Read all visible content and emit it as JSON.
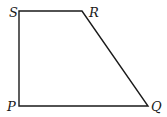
{
  "diagram": {
    "shape": "quadrilateral",
    "stroke_color": "#1a1a1a",
    "stroke_width": 1.4,
    "vertices": [
      {
        "label": "S",
        "x": 19,
        "y": 11,
        "label_x": 9,
        "label_y": 17
      },
      {
        "label": "R",
        "x": 82,
        "y": 11,
        "label_x": 89,
        "label_y": 17
      },
      {
        "label": "Q",
        "x": 148,
        "y": 106,
        "label_x": 151,
        "label_y": 111
      },
      {
        "label": "P",
        "x": 19,
        "y": 106,
        "label_x": 7,
        "label_y": 111
      }
    ],
    "edges": [
      [
        "S",
        "R"
      ],
      [
        "R",
        "Q"
      ],
      [
        "Q",
        "P"
      ],
      [
        "P",
        "S"
      ]
    ]
  }
}
